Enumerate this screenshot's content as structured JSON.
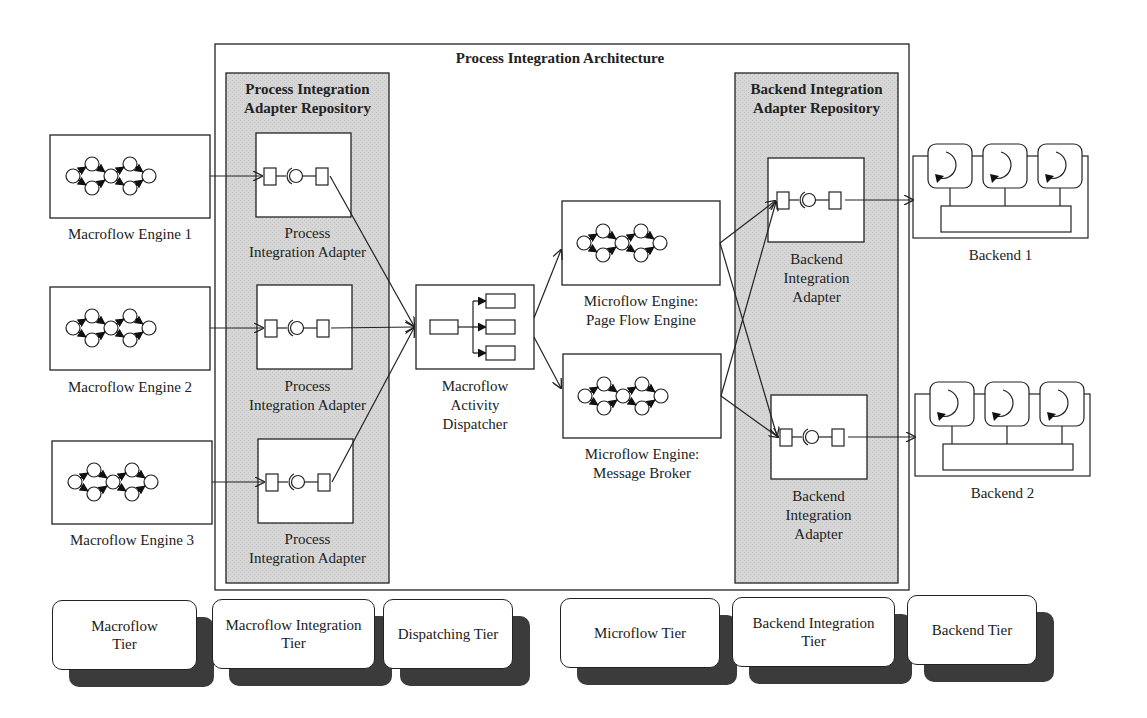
{
  "diagram": {
    "title": "Process Integration Architecture",
    "repositories": {
      "process": {
        "title_line1": "Process Integration",
        "title_line2": "Adapter Repository"
      },
      "backend": {
        "title_line1": "Backend Integration",
        "title_line2": "Adapter Repository"
      }
    },
    "macroflow_engines": [
      {
        "label": "Macroflow Engine 1"
      },
      {
        "label": "Macroflow Engine 2"
      },
      {
        "label": "Macroflow Engine 3"
      }
    ],
    "process_adapters": [
      {
        "line1": "Process",
        "line2": "Integration Adapter"
      },
      {
        "line1": "Process",
        "line2": "Integration Adapter"
      },
      {
        "line1": "Process",
        "line2": "Integration Adapter"
      }
    ],
    "dispatcher": {
      "line1": "Macroflow",
      "line2": "Activity",
      "line3": "Dispatcher"
    },
    "microflow_engines": [
      {
        "line1": "Microflow Engine:",
        "line2": "Page Flow Engine"
      },
      {
        "line1": "Microflow Engine:",
        "line2": "Message Broker"
      }
    ],
    "backend_adapters": [
      {
        "line1": "Backend",
        "line2": "Integration",
        "line3": "Adapter"
      },
      {
        "line1": "Backend",
        "line2": "Integration",
        "line3": "Adapter"
      }
    ],
    "backends": [
      {
        "label": "Backend 1"
      },
      {
        "label": "Backend 2"
      }
    ],
    "tiers": [
      {
        "line1": "Macroflow",
        "line2": "Tier"
      },
      {
        "line1": "Macroflow Integration",
        "line2": "Tier"
      },
      {
        "line1": "Dispatching Tier",
        "line2": ""
      },
      {
        "line1": "Microflow Tier",
        "line2": ""
      },
      {
        "line1": "Backend Integration",
        "line2": "Tier"
      },
      {
        "line1": "Backend Tier",
        "line2": ""
      }
    ],
    "colors": {
      "repository_fill": "#d4d4d4",
      "line": "#222222",
      "shadow": "#3b3b3b"
    }
  }
}
